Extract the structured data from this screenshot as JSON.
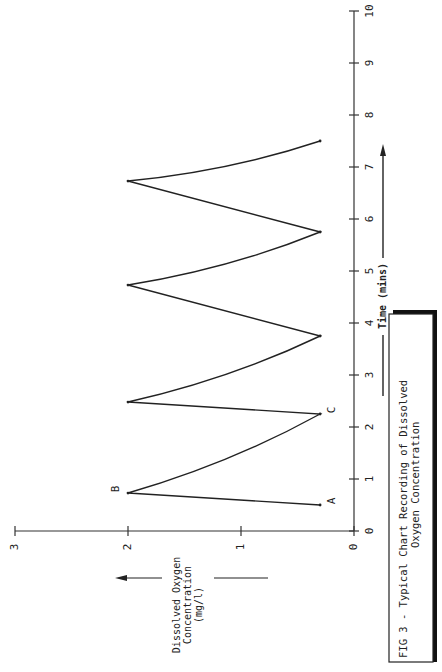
{
  "chart_data": {
    "type": "line",
    "orientation": "rotated-90-ccw",
    "caption_lines": [
      "FIG 3 - Typical Chart Recording of Dissolved",
      "Oxygen Concentration"
    ],
    "xlabel": "Time (mins)",
    "ylabel_lines": [
      "Dissolved Oxygen",
      "Concentration",
      "(mg/l)"
    ],
    "xlim": [
      0,
      10
    ],
    "ylim": [
      0,
      3
    ],
    "x_ticks": [
      "0",
      "1",
      "2",
      "3",
      "4",
      "5",
      "6",
      "7",
      "8",
      "9",
      "10"
    ],
    "y_ticks": [
      "0",
      "1",
      "2",
      "3"
    ],
    "grid": false,
    "legend": null,
    "series": [
      {
        "name": "Dissolved oxygen",
        "x": [
          0.5,
          0.73,
          2.25,
          2.48,
          3.75,
          4.73,
          5.75,
          6.73,
          7.5
        ],
        "y": [
          0.3,
          2.0,
          0.3,
          2.0,
          0.3,
          2.0,
          0.3,
          2.0,
          0.3
        ]
      }
    ],
    "annotations": [
      {
        "label": "A",
        "x": 0.5,
        "y": 0.3
      },
      {
        "label": "B",
        "x": 0.73,
        "y": 2.0
      },
      {
        "label": "C",
        "x": 2.25,
        "y": 0.3
      }
    ]
  }
}
